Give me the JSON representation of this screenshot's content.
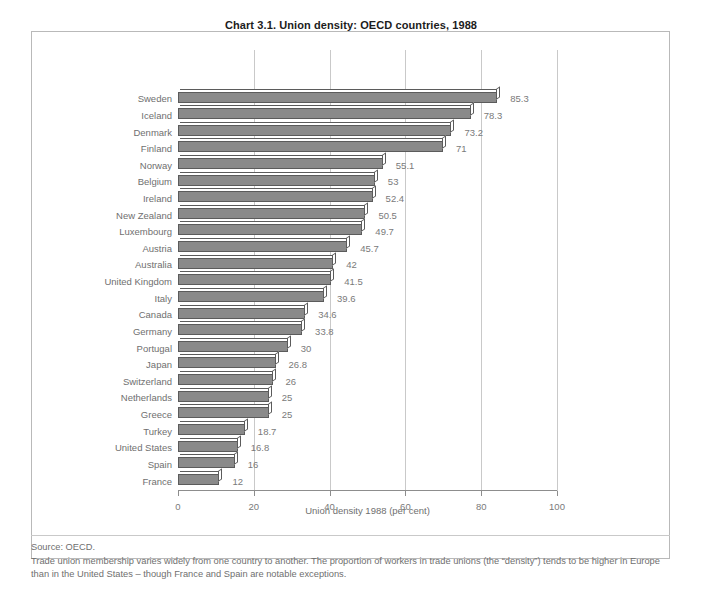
{
  "chart_data": {
    "type": "bar",
    "orientation": "horizontal",
    "title": "Chart 3.1.  Union density: OECD countries, 1988",
    "xlabel": "Union density 1988 (per cent)",
    "ylabel": "",
    "xlim": [
      0,
      100
    ],
    "xticks": [
      0,
      20,
      40,
      60,
      80,
      100
    ],
    "xtick_labels": [
      "0",
      "20",
      "40",
      "60",
      "80",
      "100"
    ],
    "grid": true,
    "grid_axis": "x",
    "legend": false,
    "bar_color": "#8a8a8a",
    "bar_edge_color": "#5b5b5b",
    "categories": [
      "Sweden",
      "Iceland",
      "Denmark",
      "Finland",
      "Norway",
      "Belgium",
      "Ireland",
      "New Zealand",
      "Luxembourg",
      "Austria",
      "Australia",
      "United Kingdom",
      "Italy",
      "Canada",
      "Germany",
      "Portugal",
      "Japan",
      "Switzerland",
      "Netherlands",
      "Greece",
      "Turkey",
      "United States",
      "Spain",
      "France"
    ],
    "values": [
      85.3,
      78.3,
      73.2,
      71,
      55.1,
      53,
      52.4,
      50.5,
      49.7,
      45.7,
      42,
      41.5,
      39.6,
      34.6,
      33.8,
      30,
      26.8,
      26,
      25,
      25,
      18.7,
      16.8,
      16,
      12
    ],
    "value_labels": [
      "85.3",
      "78.3",
      "73.2",
      "71",
      "55.1",
      "53",
      "52.4",
      "50.5",
      "49.7",
      "45.7",
      "42",
      "41.5",
      "39.6",
      "34.6",
      "33.8",
      "30",
      "26.8",
      "26",
      "25",
      "25",
      "18.7",
      "16.8",
      "16",
      "12"
    ]
  },
  "footer": {
    "source": "Source: OECD.",
    "note": "Trade union membership varies widely from one country to another. The proportion of workers in trade unions (the “density”) tends to be higher in Europe than in the United States – though France and Spain are notable exceptions."
  }
}
